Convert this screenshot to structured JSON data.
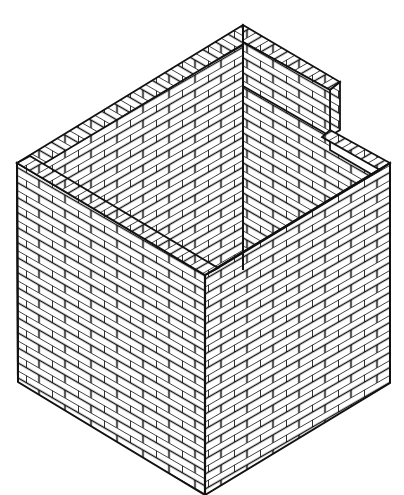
{
  "illustration": {
    "subject": "Isometric line drawing of a brick wall corner structure",
    "colors": {
      "background": "#ffffff",
      "ink": "#111111"
    }
  }
}
